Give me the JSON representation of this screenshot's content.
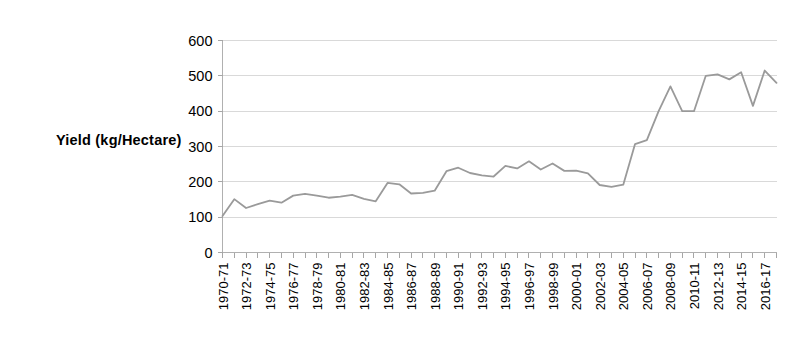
{
  "chart_data": {
    "type": "line",
    "title": "",
    "xlabel": "",
    "ylabel": "Yield  (kg/Hectare)",
    "ylim": [
      0,
      600
    ],
    "ytick_values": [
      0,
      100,
      200,
      300,
      400,
      500,
      600
    ],
    "ytick_labels": [
      "0",
      "100",
      "200",
      "300",
      "400",
      "500",
      "600"
    ],
    "grid": true,
    "legend": "none",
    "x_tick_label_rotation": -90,
    "x_tick_label_interval": 2,
    "categories": [
      "1970-71",
      "1971-72",
      "1972-73",
      "1973-74",
      "1974-75",
      "1975-76",
      "1976-77",
      "1977-78",
      "1978-79",
      "1979-80",
      "1980-81",
      "1981-82",
      "1982-83",
      "1983-84",
      "1984-85",
      "1985-86",
      "1986-87",
      "1987-88",
      "1988-89",
      "1989-90",
      "1990-91",
      "1991-92",
      "1992-93",
      "1993-94",
      "1994-95",
      "1995-96",
      "1996-97",
      "1997-98",
      "1998-99",
      "1999-00",
      "2000-01",
      "2001-02",
      "2002-03",
      "2003-04",
      "2004-05",
      "2005-06",
      "2006-07",
      "2007-08",
      "2008-09",
      "2009-10",
      "2010-11",
      "2011-12",
      "2012-13",
      "2013-14",
      "2014-15",
      "2015-16",
      "2016-17",
      "2017-18"
    ],
    "displayed_xtick_labels": [
      "1970-71",
      "1972-73",
      "1974-75",
      "1976-77",
      "1978-79",
      "1980-81",
      "1982-83",
      "1984-85",
      "1986-87",
      "1988-89",
      "1990-91",
      "1992-93",
      "1994-95",
      "1996-97",
      "1998-99",
      "2000-01",
      "2002-03",
      "2004-05",
      "2006-07",
      "2008-09",
      "2010-11",
      "2012-13",
      "2014-15",
      "2016-17"
    ],
    "values": [
      103,
      151,
      126,
      137,
      147,
      141,
      161,
      166,
      161,
      155,
      158,
      163,
      152,
      145,
      197,
      193,
      167,
      169,
      175,
      230,
      240,
      225,
      218,
      215,
      245,
      238,
      258,
      235,
      252,
      231,
      232,
      224,
      191,
      186,
      192,
      307,
      318,
      400,
      470,
      400,
      400,
      500,
      504,
      490,
      510,
      415,
      515,
      480
    ],
    "series": [
      {
        "name": "Yield",
        "color": "#9a9a9a",
        "values": [
          103,
          151,
          126,
          137,
          147,
          141,
          161,
          166,
          161,
          155,
          158,
          163,
          152,
          145,
          197,
          193,
          167,
          169,
          175,
          230,
          240,
          225,
          218,
          215,
          245,
          238,
          258,
          235,
          252,
          231,
          232,
          224,
          191,
          186,
          192,
          307,
          318,
          400,
          470,
          400,
          400,
          500,
          504,
          490,
          510,
          415,
          515,
          480
        ]
      }
    ]
  },
  "colors": {
    "line": "#9a9a9a",
    "grid": "#d9d9d9",
    "axis": "#b0b0b0",
    "text": "#000000",
    "background": "#ffffff"
  }
}
